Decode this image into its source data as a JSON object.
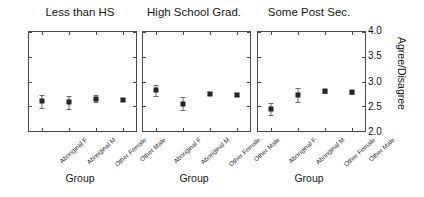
{
  "chart_data": {
    "type": "scatter",
    "title": "",
    "xlabel": "Group",
    "ylabel": "Agree/Disagree",
    "ylim": [
      2.0,
      4.0
    ],
    "yticks": [
      "2.0",
      "2.5",
      "3.0",
      "3.5",
      "4.0"
    ],
    "ytick_values": [
      2.0,
      2.5,
      3.0,
      3.5,
      4.0
    ],
    "grid": false,
    "legend": "none",
    "categories": [
      "Aboriginal F",
      "Aboriginal M",
      "Other Female",
      "Other Male"
    ],
    "panels": [
      {
        "title": "Less than HS",
        "values": [
          2.6,
          2.58,
          2.65,
          2.63
        ],
        "err_low": [
          2.47,
          2.45,
          2.58,
          2.6
        ],
        "err_high": [
          2.73,
          2.71,
          2.72,
          2.66
        ]
      },
      {
        "title": "High School Grad.",
        "values": [
          2.82,
          2.55,
          2.75,
          2.73
        ],
        "err_low": [
          2.71,
          2.42,
          2.72,
          2.7
        ],
        "err_high": [
          2.93,
          2.68,
          2.78,
          2.76
        ]
      },
      {
        "title": "Some Post Sec.",
        "values": [
          2.45,
          2.72,
          2.8,
          2.78
        ],
        "err_low": [
          2.33,
          2.58,
          2.77,
          2.75
        ],
        "err_high": [
          2.57,
          2.86,
          2.83,
          2.81
        ]
      }
    ]
  },
  "figure": {
    "panel_count": 3,
    "axis_title_x": "Group",
    "axis_title_y": "Agree/Disagree"
  }
}
